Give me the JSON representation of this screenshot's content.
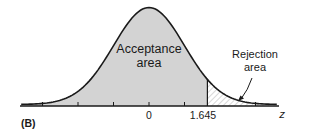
{
  "chart_data": {
    "type": "area",
    "title": "",
    "panel_label": "(B)",
    "xlabel": "z",
    "ylabel": "",
    "distribution": "standard normal",
    "x_ticks": [
      -3,
      -2,
      -1,
      0,
      1,
      3
    ],
    "x_tick_labels": [
      {
        "value": 0,
        "label": "0"
      },
      {
        "value": 1.645,
        "label": "1.645"
      }
    ],
    "xlim": [
      -3.6,
      3.6
    ],
    "critical_value": 1.645,
    "regions": [
      {
        "name": "Acceptance area",
        "from": -3.6,
        "to": 1.645,
        "fill": "gray"
      },
      {
        "name": "Rejection area",
        "from": 1.645,
        "to": 3.6,
        "fill": "hatched"
      }
    ],
    "annotations": [
      {
        "text": "Acceptance area",
        "position": "inside curve center"
      },
      {
        "text": "Rejection area",
        "position": "upper right with arrow to tail"
      }
    ],
    "grid": false,
    "legend": "none"
  },
  "labels": {
    "panel": "(B)",
    "acceptance_line1": "Acceptance",
    "acceptance_line2": "area",
    "rejection_line1": "Rejection",
    "rejection_line2": "area",
    "tick_zero": "0",
    "tick_critical": "1.645",
    "axis_var": "z"
  },
  "colors": {
    "acceptance_fill": "#d3d3d3",
    "curve": "#1a1a1a",
    "hatch": "#9a9a9a",
    "background": "#ffffff"
  }
}
